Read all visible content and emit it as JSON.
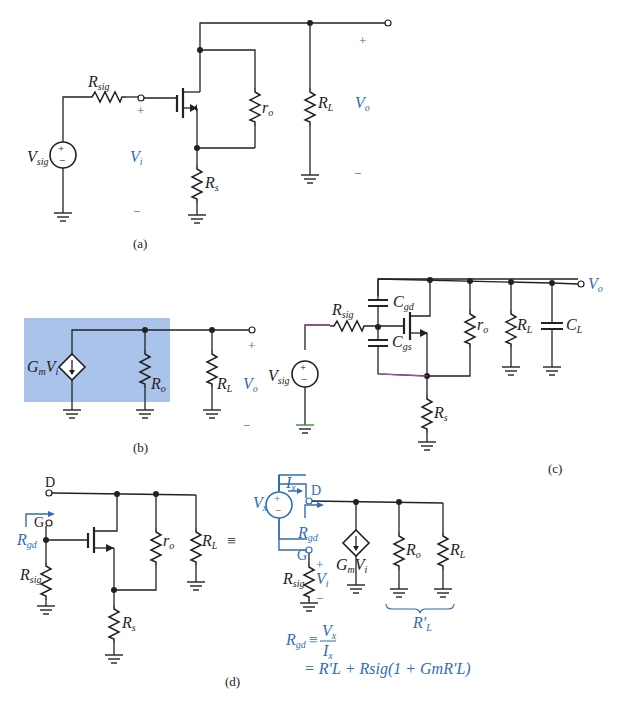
{
  "figure": {
    "accent_color": "#2f6db5",
    "highlight_color": "#a9c3ea",
    "panels": {
      "a": {
        "caption": "(a)",
        "labels": {
          "r_sig": "R",
          "r_sig_sub": "sig",
          "v_sig": "V",
          "v_sig_sub": "sig",
          "r_o": "r",
          "r_o_sub": "o",
          "r_s": "R",
          "r_s_sub": "s",
          "r_l": "R",
          "r_l_sub": "L",
          "v_i": "V",
          "v_i_sub": "i",
          "v_o": "V",
          "v_o_sub": "o",
          "plus": "+",
          "minus": "−"
        }
      },
      "b": {
        "caption": "(b)",
        "labels": {
          "gm": "G",
          "gm_sub": "m",
          "vi": "V",
          "vi_sub": "i",
          "r_o": "R",
          "r_o_sub": "o",
          "r_l": "R",
          "r_l_sub": "L",
          "v_o": "V",
          "v_o_sub": "o",
          "plus": "+",
          "minus": "−"
        }
      },
      "c": {
        "caption": "(c)",
        "labels": {
          "r_sig": "R",
          "r_sig_sub": "sig",
          "v_sig": "V",
          "v_sig_sub": "sig",
          "c_gd": "C",
          "c_gd_sub": "gd",
          "c_gs": "C",
          "c_gs_sub": "gs",
          "r_o": "r",
          "r_o_sub": "o",
          "r_l": "R",
          "r_l_sub": "L",
          "c_l": "C",
          "c_l_sub": "L",
          "r_s": "R",
          "r_s_sub": "s",
          "v_o": "V",
          "v_o_sub": "o"
        }
      },
      "d": {
        "caption": "(d)",
        "labels": {
          "d": "D",
          "g": "G",
          "r_gd": "R",
          "r_gd_sub": "gd",
          "r_sig": "R",
          "r_sig_sub": "sig",
          "r_o": "r",
          "r_o_sub": "o",
          "r_s": "R",
          "r_s_sub": "s",
          "r_l": "R",
          "r_l_sub": "L",
          "equiv": "≡",
          "v_x": "V",
          "v_x_sub": "x",
          "i_x": "I",
          "i_x_sub": "x",
          "gm": "G",
          "gm_sub": "m",
          "vi": "V",
          "vi_sub": "i",
          "R_o": "R",
          "R_o_sub": "o",
          "r_lp": "R′",
          "r_lp_sub": "L",
          "plus": "+",
          "minus": "−"
        },
        "equation_line1_lhs": "R",
        "equation_line1_lhs_sub": "gd",
        "equation_line1_eq": "≡",
        "equation_num": "V",
        "equation_num_sub": "x",
        "equation_den": "I",
        "equation_den_sub": "x",
        "equation_line2": "= R′L + Rsig(1 + GmR′L)"
      }
    }
  }
}
